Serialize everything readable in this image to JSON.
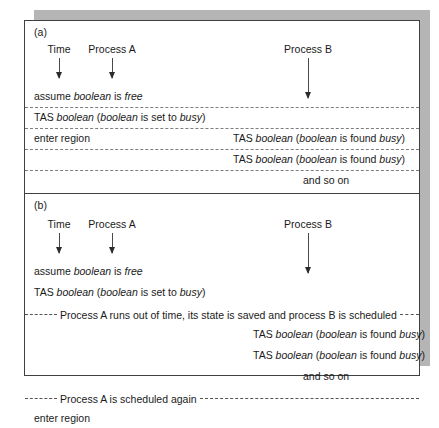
{
  "figure": {
    "panels": [
      {
        "id": "a",
        "label": "(a)",
        "columns": [
          {
            "name": "time",
            "label": "Time"
          },
          {
            "name": "process-a",
            "label": "Process A"
          },
          {
            "name": "process-b",
            "label": "Process B"
          }
        ],
        "rows": [
          {
            "left": "assume boolean is free",
            "right": ""
          },
          {
            "left": "TAS boolean (boolean is set to busy)",
            "right": ""
          },
          {
            "left": "enter region",
            "right": "TAS boolean (boolean is found busy)"
          },
          {
            "left": "",
            "right": "TAS boolean (boolean is found busy)"
          },
          {
            "left": "",
            "right": "and so on"
          }
        ]
      },
      {
        "id": "b",
        "label": "(b)",
        "columns": [
          {
            "name": "time",
            "label": "Time"
          },
          {
            "name": "process-a",
            "label": "Process A"
          },
          {
            "name": "process-b",
            "label": "Process B"
          }
        ],
        "rows": [
          {
            "left": "assume boolean is free",
            "right": ""
          },
          {
            "left": "TAS boolean (boolean is set to busy)",
            "right": ""
          }
        ],
        "annotations": [
          {
            "name": "preempt-note",
            "text": "Process A runs out of time, its state is saved and process B is scheduled"
          },
          {
            "name": "reschedule-note",
            "text": "Process A is scheduled again"
          }
        ],
        "process_b_rows": [
          "TAS boolean (boolean is found busy)",
          "TAS boolean (boolean is found busy)",
          "and so on"
        ],
        "final_row": "enter region"
      }
    ],
    "italic_terms": [
      "boolean",
      "free",
      "busy"
    ],
    "colors": {
      "frame": "#404040",
      "shadow": "#b5b5b5",
      "dashed_rule": "#7d7d7d",
      "arrow": "#2b2b2b",
      "text": "#1a1a1a",
      "background": "#ffffff"
    }
  }
}
